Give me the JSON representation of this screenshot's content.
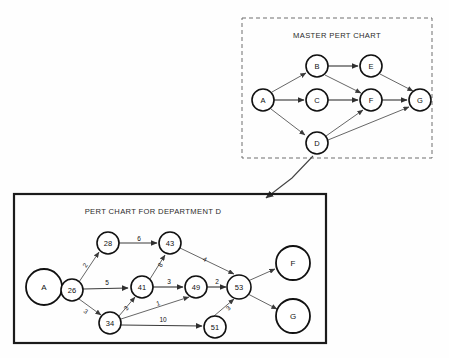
{
  "page": {
    "width": 449,
    "height": 358,
    "background": "#fefefe"
  },
  "master_chart": {
    "title": "MASTER PERT CHART",
    "border_style": "dashed",
    "border_color": "#6f6f6f",
    "frame": {
      "x": 242,
      "y": 18,
      "w": 190,
      "h": 140
    },
    "title_pos": {
      "x": 337,
      "y": 35
    },
    "nodes": [
      {
        "id": "A",
        "label": "A",
        "x": 263,
        "y": 100,
        "r": 11
      },
      {
        "id": "B",
        "label": "B",
        "x": 317,
        "y": 66,
        "r": 11
      },
      {
        "id": "C",
        "label": "C",
        "x": 317,
        "y": 100,
        "r": 11
      },
      {
        "id": "D",
        "label": "D",
        "x": 317,
        "y": 143,
        "r": 11
      },
      {
        "id": "E",
        "label": "E",
        "x": 371,
        "y": 66,
        "r": 11
      },
      {
        "id": "F",
        "label": "F",
        "x": 371,
        "y": 100,
        "r": 11
      },
      {
        "id": "G",
        "label": "G",
        "x": 420,
        "y": 100,
        "r": 11
      }
    ],
    "edges": [
      {
        "from": "A",
        "to": "B"
      },
      {
        "from": "A",
        "to": "C"
      },
      {
        "from": "A",
        "to": "D"
      },
      {
        "from": "B",
        "to": "E"
      },
      {
        "from": "B",
        "to": "F"
      },
      {
        "from": "C",
        "to": "F"
      },
      {
        "from": "D",
        "to": "F"
      },
      {
        "from": "D",
        "to": "G"
      },
      {
        "from": "E",
        "to": "G"
      },
      {
        "from": "F",
        "to": "G"
      }
    ]
  },
  "department_chart": {
    "title": "PERT CHART FOR DEPARTMENT D",
    "border_style": "solid",
    "border_color": "#1b1b1b",
    "frame": {
      "x": 14,
      "y": 194,
      "w": 312,
      "h": 149
    },
    "title_pos": {
      "x": 153,
      "y": 211
    },
    "nodes": [
      {
        "id": "A",
        "label": "A",
        "x": 44,
        "y": 287,
        "r": 18,
        "size": "big"
      },
      {
        "id": "26",
        "label": "26",
        "x": 72,
        "y": 290,
        "r": 11,
        "size": "small"
      },
      {
        "id": "28",
        "label": "28",
        "x": 108,
        "y": 243,
        "r": 11,
        "size": "small"
      },
      {
        "id": "34",
        "label": "34",
        "x": 110,
        "y": 323,
        "r": 11,
        "size": "small"
      },
      {
        "id": "41",
        "label": "41",
        "x": 142,
        "y": 287,
        "r": 11,
        "size": "small"
      },
      {
        "id": "43",
        "label": "43",
        "x": 170,
        "y": 243,
        "r": 11,
        "size": "small"
      },
      {
        "id": "49",
        "label": "49",
        "x": 196,
        "y": 287,
        "r": 11,
        "size": "small"
      },
      {
        "id": "51",
        "label": "51",
        "x": 215,
        "y": 327,
        "r": 11,
        "size": "small"
      },
      {
        "id": "53",
        "label": "53",
        "x": 239,
        "y": 287,
        "r": 12,
        "size": "small"
      },
      {
        "id": "F",
        "label": "F",
        "x": 293,
        "y": 263,
        "r": 17,
        "size": "big"
      },
      {
        "id": "G",
        "label": "G",
        "x": 293,
        "y": 316,
        "r": 17,
        "size": "big"
      }
    ],
    "edges": [
      {
        "from": "A",
        "to": "26",
        "weight": "",
        "lx": 0,
        "ly": 0
      },
      {
        "from": "26",
        "to": "28",
        "weight": "2",
        "lx": 85,
        "ly": 265
      },
      {
        "from": "26",
        "to": "41",
        "weight": "5",
        "lx": 107,
        "ly": 282
      },
      {
        "from": "26",
        "to": "34",
        "weight": "3",
        "lx": 86,
        "ly": 311
      },
      {
        "from": "28",
        "to": "43",
        "weight": "6",
        "lx": 139,
        "ly": 238
      },
      {
        "from": "34",
        "to": "41",
        "weight": "3",
        "lx": 126,
        "ly": 308
      },
      {
        "from": "41",
        "to": "43",
        "weight": "8",
        "lx": 160,
        "ly": 265
      },
      {
        "from": "41",
        "to": "49",
        "weight": "3",
        "lx": 169,
        "ly": 281
      },
      {
        "from": "34",
        "to": "49",
        "weight": "1",
        "lx": 158,
        "ly": 303
      },
      {
        "from": "34",
        "to": "51",
        "weight": "10",
        "lx": 163,
        "ly": 319
      },
      {
        "from": "43",
        "to": "53",
        "weight": "4",
        "lx": 205,
        "ly": 259
      },
      {
        "from": "49",
        "to": "53",
        "weight": "2",
        "lx": 217,
        "ly": 281
      },
      {
        "from": "51",
        "to": "53",
        "weight": "3",
        "lx": 228,
        "ly": 308
      },
      {
        "from": "53",
        "to": "F",
        "weight": "",
        "lx": 0,
        "ly": 0
      },
      {
        "from": "53",
        "to": "G",
        "weight": "",
        "lx": 0,
        "ly": 0
      }
    ]
  },
  "link": {
    "description": "expansion-arrow-from-master-node-d-to-department-chart",
    "from_node": "D",
    "path": "M 313 156 L 292 178 L 266 198",
    "arrow_tip": {
      "x": 266,
      "y": 198
    }
  }
}
